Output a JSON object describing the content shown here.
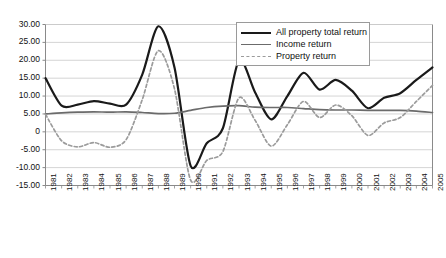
{
  "chart_data": {
    "type": "line",
    "title": "",
    "xlabel": "",
    "ylabel": "",
    "ylim": [
      -15,
      30
    ],
    "ytick_step": 5,
    "grid": true,
    "legend_position": "top-right",
    "x": [
      1981,
      1982,
      1983,
      1984,
      1985,
      1986,
      1987,
      1988,
      1989,
      1990,
      1991,
      1992,
      1993,
      1994,
      1995,
      1996,
      1997,
      1998,
      1999,
      2000,
      2001,
      2002,
      2003,
      2004,
      2005
    ],
    "ytick_labels": [
      "30.00",
      "25.00",
      "20.00",
      "15.00",
      "10.00",
      "5.00",
      "0",
      "-5.00",
      "-10.00",
      "-15.00"
    ],
    "ytick_values": [
      30,
      25,
      20,
      15,
      10,
      5,
      0,
      -5,
      -10,
      -15
    ],
    "xtick_labels": [
      "1981",
      "1982",
      "1983",
      "1984",
      "1985",
      "1986",
      "1987",
      "1988",
      "1989",
      "1990",
      "1991",
      "1992",
      "1993",
      "1994",
      "1995",
      "1996",
      "1997",
      "1998",
      "1999",
      "2000",
      "2001",
      "2002",
      "2003",
      "2004",
      "2005"
    ],
    "series": [
      {
        "name": "All property total return",
        "color": "#1a1a1a",
        "style": "solid",
        "width": 2.2,
        "values": [
          15.0,
          7.3,
          7.6,
          8.6,
          7.9,
          7.6,
          16.0,
          29.5,
          18.0,
          -9.5,
          -3.2,
          1.0,
          20.0,
          11.0,
          3.5,
          10.0,
          16.5,
          11.8,
          14.5,
          11.5,
          6.6,
          9.5,
          10.8,
          14.5,
          18.0
        ]
      },
      {
        "name": "Income return",
        "color": "#6b6b6b",
        "style": "solid",
        "width": 1.7,
        "values": [
          5.0,
          5.3,
          5.5,
          5.6,
          5.5,
          5.6,
          5.4,
          5.1,
          5.2,
          6.0,
          6.8,
          7.2,
          7.3,
          6.9,
          6.8,
          6.8,
          6.5,
          6.2,
          6.1,
          6.1,
          6.0,
          6.0,
          6.0,
          5.8,
          5.4
        ]
      },
      {
        "name": "Property return",
        "color": "#9b9b9b",
        "style": "dashed",
        "width": 1.7,
        "values": [
          4.9,
          -2.5,
          -4.2,
          -3.0,
          -4.3,
          -2.2,
          9.0,
          22.7,
          12.0,
          -13.5,
          -8.0,
          -5.5,
          9.5,
          3.2,
          -4.0,
          2.0,
          8.5,
          4.0,
          7.5,
          4.5,
          -1.0,
          2.5,
          4.0,
          8.5,
          13.0
        ]
      }
    ]
  },
  "legend": {
    "items": [
      {
        "label": "All property total return",
        "swatch": "solid-thick"
      },
      {
        "label": "Income return",
        "swatch": "solid-thin"
      },
      {
        "label": "Property return",
        "swatch": "dashed"
      }
    ]
  }
}
